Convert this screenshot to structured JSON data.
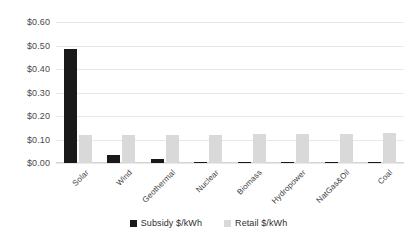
{
  "chart_data": {
    "type": "bar",
    "title": "",
    "subtitle": "",
    "xlabel": "",
    "ylabel": "",
    "categories": [
      "Solar",
      "Wind",
      "Geothermal",
      "Nuclear",
      "Biomass",
      "Hydropower",
      "NatGas&Oil",
      "Coal"
    ],
    "series": [
      {
        "name": "Subsidy $/kWh",
        "color": "#191919",
        "values": [
          0.485,
          0.035,
          0.017,
          0.004,
          0.004,
          0.004,
          0.005,
          0.005
        ]
      },
      {
        "name": "Retail $/kWh",
        "color": "#d9d9d9",
        "values": [
          0.118,
          0.118,
          0.12,
          0.121,
          0.122,
          0.123,
          0.125,
          0.126
        ]
      }
    ],
    "ylim": [
      0.0,
      0.6
    ],
    "y_ticks": [
      0.0,
      0.1,
      0.2,
      0.3,
      0.4,
      0.5,
      0.6
    ],
    "y_tick_labels": [
      "$0.00",
      "$0.10",
      "$0.20",
      "$0.30",
      "$0.40",
      "$0.50",
      "$0.60"
    ],
    "grid": true,
    "grid_axis": "y",
    "legend_position": "bottom",
    "legend": [
      "Subsidy $/kWh",
      "Retail $/kWh"
    ],
    "x_tick_rotation": -45,
    "background": "#ffffff"
  }
}
